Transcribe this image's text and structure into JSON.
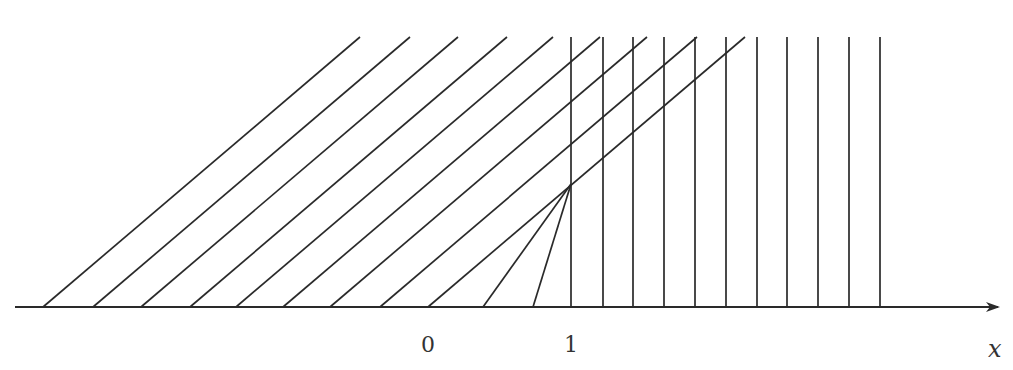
{
  "diagram": {
    "type": "characteristics-diagram",
    "axis": {
      "label": "x",
      "tick_labels": [
        {
          "value": "0",
          "px": 428
        },
        {
          "value": "1",
          "px": 571
        }
      ],
      "y_px": 307,
      "x_start_px": 15,
      "x_end_px": 998
    },
    "top_y_px": 37,
    "slope_dx_per_dy": 1.174,
    "slanted_line_feet_px": [
      43,
      93,
      141,
      190,
      236,
      283,
      330,
      380,
      428
    ],
    "fan": {
      "apex_px": [
        571,
        184
      ],
      "feet_px": [
        483,
        533
      ]
    },
    "vertical_lines_px": [
      571,
      603,
      633,
      664,
      695,
      726,
      757,
      787,
      818,
      849,
      880
    ],
    "colors": {
      "line": "#2a2a2a",
      "label": "#333333",
      "background": "#ffffff"
    }
  }
}
